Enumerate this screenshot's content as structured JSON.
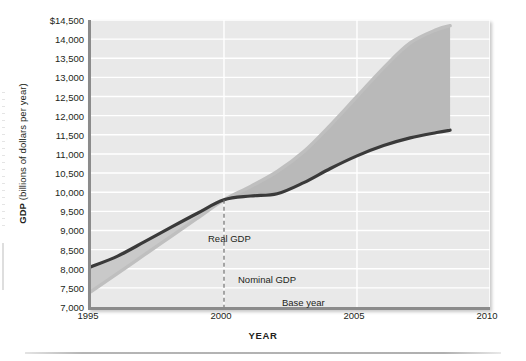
{
  "chart_data": {
    "type": "line",
    "title": "",
    "xlabel": "YEAR",
    "ylabel": "GDP (billions of dollars per year)",
    "ylabel_bold_part": "GDP",
    "ylabel_rest": " (billions of dollars per year)",
    "xlim": [
      1995,
      2010
    ],
    "ylim": [
      7000,
      14500
    ],
    "xticks": [
      1995,
      2000,
      2005,
      2010
    ],
    "xtick_labels": [
      "1995",
      "2000",
      "2005",
      "2010"
    ],
    "yticks": [
      7000,
      7500,
      8000,
      8500,
      9000,
      9500,
      10000,
      10500,
      11000,
      11500,
      12000,
      12500,
      13000,
      13500,
      14000,
      14500
    ],
    "ytick_labels": [
      "7,000",
      "7,500",
      "8,000",
      "8,500",
      "9,000",
      "9,500",
      "10,000",
      "10,500",
      "11,000",
      "11,500",
      "12,000",
      "12,500",
      "13,000",
      "13,500",
      "14,000",
      "$14,500"
    ],
    "grid": true,
    "grid_color": "#ffffff",
    "plot_background": "#e9e9e9",
    "legend_position": "inline-annotations",
    "base_year": 2000,
    "base_year_value": 9800,
    "series": [
      {
        "name": "Real GDP",
        "color": "#3a3a3a",
        "x": [
          1995,
          1996,
          1997,
          1998,
          1999,
          2000,
          2001,
          2002,
          2003,
          2004,
          2005,
          2006,
          2007,
          2008,
          2008.5
        ],
        "values": [
          8050,
          8330,
          8700,
          9080,
          9450,
          9800,
          9900,
          9960,
          10250,
          10620,
          10950,
          11220,
          11420,
          11560,
          11620
        ]
      },
      {
        "name": "Nominal GDP",
        "color": "#bfbfbf",
        "x": [
          1995,
          1996,
          1997,
          1998,
          1999,
          2000,
          2001,
          2002,
          2003,
          2004,
          2005,
          2006,
          2007,
          2008,
          2008.5
        ],
        "values": [
          7400,
          7880,
          8360,
          8840,
          9320,
          9800,
          10150,
          10540,
          11060,
          11750,
          12500,
          13250,
          13900,
          14250,
          14350
        ]
      }
    ],
    "fill_between": {
      "from_series": "Real GDP",
      "to_series": "Nominal GDP",
      "color": "#b9b9b9",
      "start_year": 2000
    },
    "annotations": [
      {
        "text": "Real GDP",
        "x": 1996.2,
        "y": 9250
      },
      {
        "text": "Nominal GDP",
        "x": 1997.3,
        "y": 8200
      },
      {
        "text": "Base year",
        "x": 1998.9,
        "y": 7600
      }
    ]
  },
  "axis": {
    "y_title_bold": "GDP",
    "y_title_rest": "(billions of dollars per year)",
    "x_title": "YEAR"
  }
}
